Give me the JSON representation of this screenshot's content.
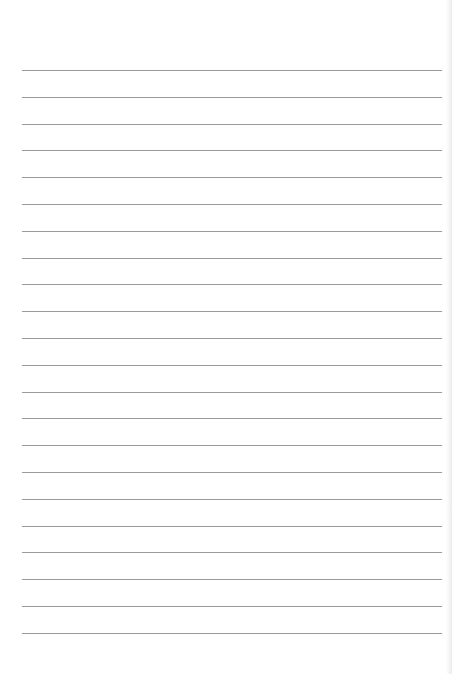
{
  "page": {
    "type": "lined-paper",
    "background_color": "#ffffff",
    "rule_color": "#9a9a9a",
    "rule_count": 22,
    "first_rule_y": 70,
    "rule_spacing": 26.8,
    "rule_left": 22,
    "rule_right": 442
  }
}
